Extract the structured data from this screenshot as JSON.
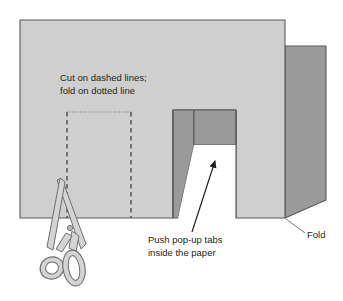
{
  "figure": {
    "background_color": "#ffffff",
    "width": 343,
    "height": 301
  },
  "colors": {
    "paper_light": "#cfcfcf",
    "paper_dark": "#9a9a9a",
    "outline": "#58595b",
    "line": "#231f20",
    "white": "#ffffff",
    "scissor_body": "#d4d4d4",
    "scissor_outline": "#6d6e71"
  },
  "labels": {
    "cut_fold": {
      "line1": "Cut on dashed lines;",
      "line2": "fold on dotted line"
    },
    "push_tabs": {
      "line1": "Push pop-up tabs",
      "line2": "inside the paper"
    },
    "fold": {
      "text": "Fold"
    }
  },
  "parts": {
    "main_panel": "paper-main-panel",
    "fold_flap": "paper-fold-flap",
    "popup_tab_left": "popup-tab-left",
    "popup_tab_right": "popup-tab-right",
    "cut_line_left": "cut-line-left-dashed",
    "cut_line_right": "cut-line-right-dashed",
    "fold_line": "fold-line-dotted",
    "scissors": "scissors-illustration",
    "arrow_tabs": "leader-arrow-push-tabs",
    "leader_fold": "leader-line-fold"
  }
}
